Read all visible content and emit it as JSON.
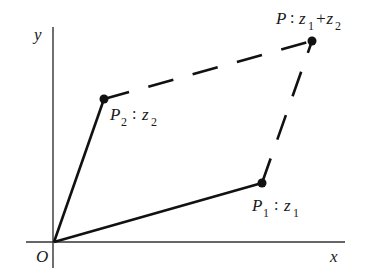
{
  "diagram": {
    "title": "",
    "type": "complex-number-parallelogram-addition",
    "axes": {
      "x_label": "x",
      "y_label": "y",
      "origin_label": "O"
    },
    "points": [
      {
        "id": "P1",
        "name": "P",
        "sub": "1",
        "value": "z",
        "value_sub": "1",
        "suffix": "",
        "suffix_sub": ""
      },
      {
        "id": "P2",
        "name": "P",
        "sub": "2",
        "value": "z",
        "value_sub": "2",
        "suffix": "",
        "suffix_sub": ""
      },
      {
        "id": "P",
        "name": "P",
        "sub": "",
        "value": "z",
        "value_sub": "1",
        "suffix": "+z",
        "suffix_sub": "2"
      }
    ],
    "separator": ":",
    "edges": [
      {
        "from": "O",
        "to": "P1",
        "style": "solid"
      },
      {
        "from": "O",
        "to": "P2",
        "style": "solid"
      },
      {
        "from": "P2",
        "to": "P",
        "style": "dashed"
      },
      {
        "from": "P1",
        "to": "P",
        "style": "dashed"
      }
    ],
    "colors": {
      "ink": "#1a1a1a",
      "background": "#ffffff"
    }
  }
}
